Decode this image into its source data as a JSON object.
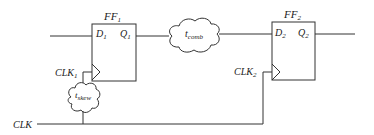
{
  "diagram": {
    "type": "clock-skew timing circuit",
    "ff1": {
      "name": "FF",
      "name_sub": "1",
      "d": "D",
      "d_sub": "1",
      "q": "Q",
      "q_sub": "1",
      "clk": "CLK",
      "clk_sub": "1"
    },
    "ff2": {
      "name": "FF",
      "name_sub": "2",
      "d": "D",
      "d_sub": "2",
      "q": "Q",
      "q_sub": "2",
      "clk": "CLK",
      "clk_sub": "2"
    },
    "comb_cloud": {
      "label": "t",
      "label_sub": "comb"
    },
    "skew_cloud": {
      "label": "t",
      "label_sub": "skew"
    },
    "clock_source": {
      "label": "CLK"
    },
    "colors": {
      "stroke": "#333333",
      "background": "#ffffff"
    }
  }
}
